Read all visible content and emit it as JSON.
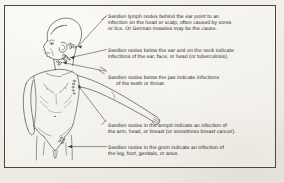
{
  "figure": {
    "ink_color": "#2a2824",
    "paper_color": "#f3f1ec",
    "border_color": "#4b4842"
  },
  "callouts": [
    {
      "id": "behind-ear",
      "anchor": "behind-the-ear-nodes",
      "text": "Swollen lymph nodes behind the ear point to an\ninfection on the head or scalp, often caused by sores\nor lice. Or German measles may be the cause."
    },
    {
      "id": "below-ear-neck",
      "anchor": "below-ear-and-neck-nodes",
      "text": "Swollen nodes below the ear and on the neck indicate\ninfections of the ear, face, or head (or tuberculosis)."
    },
    {
      "id": "below-jaw",
      "anchor": "below-jaw-nodes",
      "line1": "Swollen nodes below the  jaw indicate infections",
      "line2": "of the teeth or throat."
    },
    {
      "id": "armpit",
      "anchor": "armpit-nodes",
      "text": "Swollen nodes in the armpit indicate an infection of\nthe arm, head, or breast (or sometimes breast cancer)."
    },
    {
      "id": "groin",
      "anchor": "groin-nodes",
      "text": "Swollen nodes in the groin indicate an infection of\nthe leg, foot, genitals, or anus."
    }
  ]
}
